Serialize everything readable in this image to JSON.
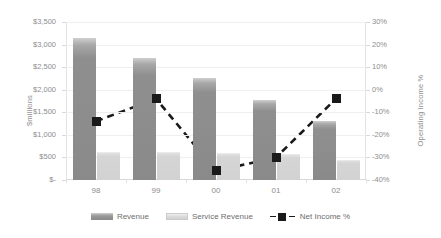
{
  "chart_data": {
    "type": "bar",
    "title": "",
    "subtitle": "",
    "xlabel": "",
    "ylabel": "$millions",
    "y2label": "Operating Income %",
    "grid": true,
    "legend_position": "bottom",
    "categories": [
      "98",
      "99",
      "00",
      "01",
      "02"
    ],
    "ylim": [
      0,
      3500
    ],
    "ytick_labels": [
      "$3,500",
      "$3,000",
      "$2,500",
      "$2,000",
      "$1,500",
      "$1,000",
      "$500",
      "$-"
    ],
    "ytick_values": [
      3500,
      3000,
      2500,
      2000,
      1500,
      1000,
      500,
      0
    ],
    "y2lim": [
      -40,
      30
    ],
    "y2tick_labels": [
      "30%",
      "20%",
      "10%",
      "0%",
      "-10%",
      "-20%",
      "-30%",
      "-40%"
    ],
    "y2tick_values": [
      30,
      20,
      10,
      0,
      -10,
      -20,
      -30,
      -40
    ],
    "series": [
      {
        "name": "Revenue",
        "type": "bar",
        "axis": "left",
        "color": "#8a8a8a",
        "values": [
          3150,
          2700,
          2250,
          1780,
          1300
        ]
      },
      {
        "name": "Service Revenue",
        "type": "bar",
        "axis": "left",
        "color": "#d2d2d2",
        "values": [
          620,
          610,
          600,
          580,
          450
        ]
      },
      {
        "name": "Net Income %",
        "type": "line",
        "axis": "right",
        "color": "#1a1a1a",
        "line_style": "dashed",
        "marker": "square",
        "values": [
          -14,
          -4,
          -36,
          -30,
          -4
        ]
      }
    ]
  },
  "legend": {
    "items": [
      {
        "label": "Revenue",
        "swatch": "revenue-swatch"
      },
      {
        "label": "Service Revenue",
        "swatch": "service-revenue-swatch"
      },
      {
        "label": "Net Income %",
        "swatch": "net-income-line-swatch"
      }
    ]
  }
}
